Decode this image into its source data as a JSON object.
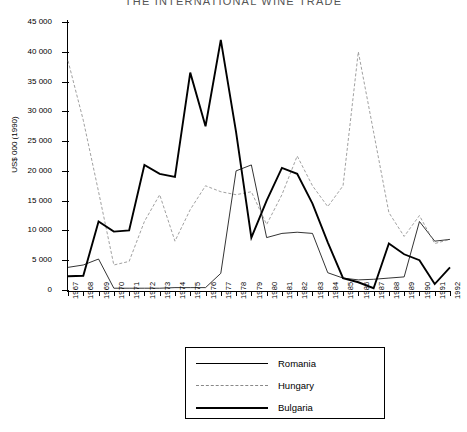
{
  "chart_data": {
    "type": "line",
    "title": "THE INTERNATIONAL WINE TRADE",
    "xlabel": "",
    "ylabel": "US$ 000 (1990)",
    "ylim": [
      0,
      45000
    ],
    "ytick_labels": [
      "45 000",
      "40 000",
      "35 000",
      "30 000",
      "25 000",
      "20 000",
      "15 000",
      "10 000",
      "5 000",
      "0"
    ],
    "ytick_values": [
      45000,
      40000,
      35000,
      30000,
      25000,
      20000,
      15000,
      10000,
      5000,
      0
    ],
    "grid": false,
    "legend_position": "bottom-center",
    "categories": [
      "1967",
      "1968",
      "1969",
      "1970",
      "1971",
      "1972",
      "1973",
      "1974",
      "1975",
      "1976",
      "1977",
      "1978",
      "1979",
      "1980",
      "1981",
      "1982",
      "1983",
      "1984",
      "1985",
      "1986",
      "1987",
      "1988",
      "1989",
      "1990",
      "1991",
      "1992"
    ],
    "series": [
      {
        "name": "Romania",
        "style": "thin-solid",
        "color": "#000000",
        "values": [
          3800,
          4200,
          5200,
          300,
          300,
          300,
          300,
          400,
          400,
          400,
          2800,
          20000,
          21000,
          8800,
          9500,
          9700,
          9500,
          2900,
          2000,
          1700,
          1800,
          2000,
          2200,
          11500,
          8200,
          8500
        ]
      },
      {
        "name": "Hungary",
        "style": "dashed",
        "color": "#888888",
        "values": [
          38500,
          28500,
          16500,
          4200,
          4800,
          11500,
          16000,
          8200,
          13500,
          17500,
          16500,
          16000,
          16500,
          11000,
          16000,
          22500,
          17500,
          14000,
          17500,
          40000,
          26500,
          13000,
          9000,
          12500,
          7800,
          8500
        ]
      },
      {
        "name": "Bulgaria",
        "style": "thick-solid",
        "color": "#000000",
        "values": [
          2300,
          2400,
          11500,
          9800,
          10000,
          21000,
          19500,
          19000,
          36500,
          27500,
          42000,
          26500,
          8800,
          15000,
          20500,
          19500,
          14500,
          8000,
          2000,
          1300,
          300,
          7800,
          6000,
          5000,
          1000,
          3800
        ]
      }
    ]
  },
  "legend": {
    "items": [
      {
        "label": "Romania"
      },
      {
        "label": "Hungary"
      },
      {
        "label": "Bulgaria"
      }
    ]
  }
}
